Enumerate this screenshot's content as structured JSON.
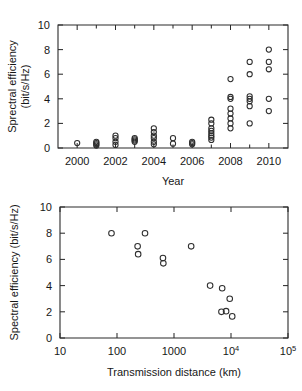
{
  "figures": {
    "top": {
      "name": "spectral-efficiency-vs-year",
      "xlabel": "Year",
      "ylabel_line1": "Sprectral efficiency",
      "ylabel_line2": "(bit/s/Hz)",
      "xticks": [
        "2000",
        "2002",
        "2004",
        "2006",
        "2008",
        "2010"
      ],
      "yticks": [
        "0",
        "2",
        "4",
        "6",
        "8",
        "10"
      ]
    },
    "bottom": {
      "name": "spectral-efficiency-vs-distance",
      "xlabel": "Transmission distance (km)",
      "ylabel": "Spectral efficiency (bit/s/Hz)",
      "xticks": [
        {
          "base": "10",
          "exp": ""
        },
        {
          "base": "100",
          "exp": ""
        },
        {
          "base": "1000",
          "exp": ""
        },
        {
          "base": "10",
          "exp": "4"
        },
        {
          "base": "10",
          "exp": "5"
        }
      ],
      "yticks": [
        "0",
        "2",
        "4",
        "6",
        "8",
        "10"
      ]
    }
  },
  "chart_data": [
    {
      "type": "scatter",
      "id": "top",
      "title": "",
      "xlabel": "Year",
      "ylabel": "Sprectral efficiency (bit/s/Hz)",
      "xlim": [
        1999,
        2011
      ],
      "ylim": [
        0,
        10
      ],
      "xticks": [
        2000,
        2002,
        2004,
        2006,
        2008,
        2010
      ],
      "yticks": [
        0,
        2,
        4,
        6,
        8,
        10
      ],
      "minor_xticks": [
        2001,
        2003,
        2005,
        2007,
        2009
      ],
      "grid": false,
      "legend": null,
      "marker": "open-circle",
      "points": [
        {
          "x": 2000,
          "y": 0.4
        },
        {
          "x": 2001,
          "y": 0.2
        },
        {
          "x": 2001,
          "y": 0.3
        },
        {
          "x": 2001,
          "y": 0.4
        },
        {
          "x": 2001,
          "y": 0.5
        },
        {
          "x": 2002,
          "y": 0.25
        },
        {
          "x": 2002,
          "y": 0.5
        },
        {
          "x": 2002,
          "y": 0.8
        },
        {
          "x": 2002,
          "y": 1.0
        },
        {
          "x": 2003,
          "y": 0.5
        },
        {
          "x": 2003,
          "y": 0.6
        },
        {
          "x": 2003,
          "y": 0.7
        },
        {
          "x": 2003,
          "y": 0.8
        },
        {
          "x": 2004,
          "y": 0.3
        },
        {
          "x": 2004,
          "y": 0.5
        },
        {
          "x": 2004,
          "y": 0.8
        },
        {
          "x": 2004,
          "y": 1.0
        },
        {
          "x": 2004,
          "y": 1.3
        },
        {
          "x": 2004,
          "y": 1.6
        },
        {
          "x": 2005,
          "y": 0.35
        },
        {
          "x": 2005,
          "y": 0.8
        },
        {
          "x": 2006,
          "y": 0.3
        },
        {
          "x": 2006,
          "y": 0.4
        },
        {
          "x": 2006,
          "y": 0.5
        },
        {
          "x": 2007,
          "y": 0.65
        },
        {
          "x": 2007,
          "y": 0.85
        },
        {
          "x": 2007,
          "y": 1.0
        },
        {
          "x": 2007,
          "y": 1.2
        },
        {
          "x": 2007,
          "y": 1.4
        },
        {
          "x": 2007,
          "y": 1.6
        },
        {
          "x": 2007,
          "y": 2.0
        },
        {
          "x": 2007,
          "y": 2.3
        },
        {
          "x": 2008,
          "y": 1.6
        },
        {
          "x": 2008,
          "y": 2.0
        },
        {
          "x": 2008,
          "y": 2.4
        },
        {
          "x": 2008,
          "y": 2.8
        },
        {
          "x": 2008,
          "y": 3.2
        },
        {
          "x": 2008,
          "y": 4.0
        },
        {
          "x": 2008,
          "y": 4.15
        },
        {
          "x": 2008,
          "y": 5.6
        },
        {
          "x": 2009,
          "y": 2.0
        },
        {
          "x": 2009,
          "y": 3.4
        },
        {
          "x": 2009,
          "y": 3.8
        },
        {
          "x": 2009,
          "y": 4.0
        },
        {
          "x": 2009,
          "y": 4.2
        },
        {
          "x": 2009,
          "y": 6.0
        },
        {
          "x": 2009,
          "y": 7.0
        },
        {
          "x": 2010,
          "y": 3.0
        },
        {
          "x": 2010,
          "y": 4.0
        },
        {
          "x": 2010,
          "y": 6.4
        },
        {
          "x": 2010,
          "y": 7.0
        },
        {
          "x": 2010,
          "y": 8.0
        }
      ]
    },
    {
      "type": "scatter",
      "id": "bottom",
      "title": "",
      "xlabel": "Transmission distance (km)",
      "ylabel": "Spectral efficiency (bit/s/Hz)",
      "xscale": "log",
      "xlim": [
        10,
        100000
      ],
      "ylim": [
        0,
        10
      ],
      "xticks": [
        10,
        100,
        1000,
        10000,
        100000
      ],
      "yticks": [
        0,
        2,
        4,
        6,
        8,
        10
      ],
      "grid": false,
      "legend": null,
      "marker": "open-circle",
      "points": [
        {
          "x": 80,
          "y": 8.0
        },
        {
          "x": 230,
          "y": 7.0
        },
        {
          "x": 235,
          "y": 6.4
        },
        {
          "x": 310,
          "y": 8.0
        },
        {
          "x": 640,
          "y": 6.1
        },
        {
          "x": 650,
          "y": 5.7
        },
        {
          "x": 2000,
          "y": 7.0
        },
        {
          "x": 4300,
          "y": 4.0
        },
        {
          "x": 7000,
          "y": 3.8
        },
        {
          "x": 9500,
          "y": 3.0
        },
        {
          "x": 6800,
          "y": 2.0
        },
        {
          "x": 8200,
          "y": 2.05
        },
        {
          "x": 10500,
          "y": 1.65
        }
      ]
    }
  ]
}
